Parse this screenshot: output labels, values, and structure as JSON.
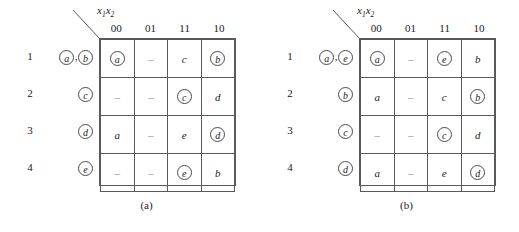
{
  "figure": {
    "column_header_label": "x1x2",
    "column_header_sub1": "1",
    "column_header_sub2": "2",
    "column_header_var1": "x",
    "column_header_var2": "x"
  },
  "panels": [
    {
      "caption": "(a)",
      "columns": [
        "00",
        "01",
        "11",
        "10"
      ],
      "rows": [
        {
          "number": "1",
          "states": [
            {
              "text": "a",
              "circled": true
            },
            {
              "text": "b",
              "circled": true
            }
          ],
          "cells": [
            {
              "text": "a",
              "circled": true
            },
            {
              "text": "–",
              "circled": false,
              "dash": true
            },
            {
              "text": "c",
              "circled": false
            },
            {
              "text": "b",
              "circled": true
            }
          ]
        },
        {
          "number": "2",
          "states": [
            {
              "text": "c",
              "circled": true
            }
          ],
          "cells": [
            {
              "text": "–",
              "circled": false,
              "dash": true
            },
            {
              "text": "–",
              "circled": false,
              "dash": true
            },
            {
              "text": "c",
              "circled": true
            },
            {
              "text": "d",
              "circled": false
            }
          ]
        },
        {
          "number": "3",
          "states": [
            {
              "text": "d",
              "circled": true
            }
          ],
          "cells": [
            {
              "text": "a",
              "circled": false
            },
            {
              "text": "–",
              "circled": false,
              "dash": true
            },
            {
              "text": "e",
              "circled": false
            },
            {
              "text": "d",
              "circled": true
            }
          ]
        },
        {
          "number": "4",
          "states": [
            {
              "text": "e",
              "circled": true
            }
          ],
          "cells": [
            {
              "text": "–",
              "circled": false,
              "dash": true
            },
            {
              "text": "–",
              "circled": false,
              "dash": true
            },
            {
              "text": "e",
              "circled": true
            },
            {
              "text": "b",
              "circled": false
            }
          ]
        }
      ]
    },
    {
      "caption": "(b)",
      "columns": [
        "00",
        "01",
        "11",
        "10"
      ],
      "rows": [
        {
          "number": "1",
          "states": [
            {
              "text": "a",
              "circled": true
            },
            {
              "text": "e",
              "circled": true
            }
          ],
          "cells": [
            {
              "text": "a",
              "circled": true
            },
            {
              "text": "–",
              "circled": false,
              "dash": true
            },
            {
              "text": "e",
              "circled": true
            },
            {
              "text": "b",
              "circled": false
            }
          ]
        },
        {
          "number": "2",
          "states": [
            {
              "text": "b",
              "circled": true
            }
          ],
          "cells": [
            {
              "text": "a",
              "circled": false
            },
            {
              "text": "–",
              "circled": false,
              "dash": true
            },
            {
              "text": "c",
              "circled": false
            },
            {
              "text": "b",
              "circled": true
            }
          ]
        },
        {
          "number": "3",
          "states": [
            {
              "text": "c",
              "circled": true
            }
          ],
          "cells": [
            {
              "text": "–",
              "circled": false,
              "dash": true
            },
            {
              "text": "–",
              "circled": false,
              "dash": true
            },
            {
              "text": "c",
              "circled": true
            },
            {
              "text": "d",
              "circled": false
            }
          ]
        },
        {
          "number": "4",
          "states": [
            {
              "text": "d",
              "circled": true
            }
          ],
          "cells": [
            {
              "text": "a",
              "circled": false
            },
            {
              "text": "–",
              "circled": false,
              "dash": true
            },
            {
              "text": "e",
              "circled": false
            },
            {
              "text": "d",
              "circled": true
            }
          ]
        }
      ]
    }
  ],
  "colors": {
    "line": "#5a5a5a",
    "text": "#1a1a1a",
    "dash": "#8a8a8a"
  }
}
